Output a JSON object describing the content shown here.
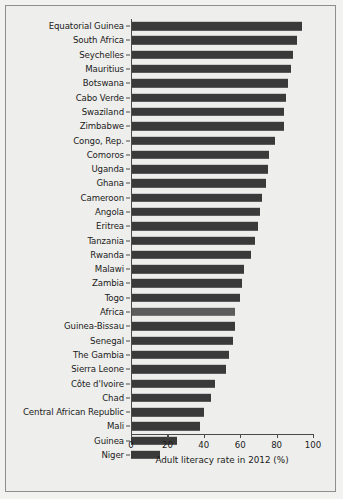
{
  "chart_data": {
    "type": "bar",
    "orientation": "horizontal",
    "title": "",
    "xlabel": "Adult literacy rate in 2012 (%)",
    "ylabel": "",
    "xlim": [
      0,
      100
    ],
    "xticks": [
      0,
      20,
      40,
      60,
      80,
      100
    ],
    "grid": false,
    "legend": null,
    "highlight_category": "Africa",
    "colors": {
      "bar": "#3a3a3a",
      "highlight_bar": "#5c5c5c",
      "background": "#eeeeec",
      "axis": "#4a4a4a",
      "text": "#1b1b1b",
      "frame_border": "#8e8e8e"
    },
    "categories": [
      "Equatorial Guinea",
      "South Africa",
      "Seychelles",
      "Mauritius",
      "Botswana",
      "Cabo Verde",
      "Swaziland",
      "Zimbabwe",
      "Congo, Rep.",
      "Comoros",
      "Uganda",
      "Ghana",
      "Cameroon",
      "Angola",
      "Eritrea",
      "Tanzania",
      "Rwanda",
      "Malawi",
      "Zambia",
      "Togo",
      "Africa",
      "Guinea-Bissau",
      "Senegal",
      "The Gambia",
      "Sierra Leone",
      "Côte d'Ivoire",
      "Chad",
      "Central African Republic",
      "Mali",
      "Guinea",
      "Niger"
    ],
    "values": [
      94,
      91,
      89,
      88,
      86,
      85,
      84,
      84,
      79,
      76,
      75,
      74,
      72,
      71,
      70,
      68,
      66,
      62,
      61,
      60,
      57,
      57,
      56,
      54,
      52,
      46,
      44,
      40,
      38,
      25,
      16
    ]
  }
}
